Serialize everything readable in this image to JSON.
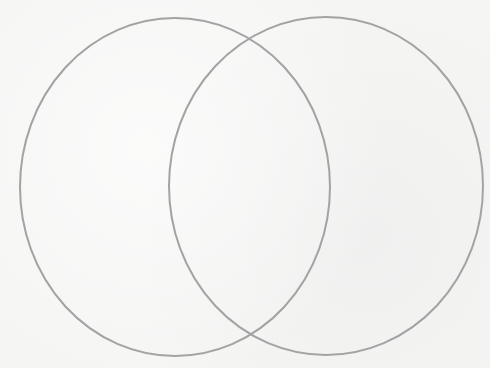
{
  "diagram": {
    "type": "venn",
    "background_color": "#f5f5f4",
    "stroke_color": "#a3a3a3",
    "stroke_width": 2,
    "sets": [
      {
        "id": "left",
        "label": "",
        "cx": 175,
        "cy": 187,
        "rx": 155,
        "ry": 169
      },
      {
        "id": "right",
        "label": "",
        "cx": 326,
        "cy": 186,
        "rx": 157,
        "ry": 169
      }
    ],
    "intersection_label": ""
  }
}
